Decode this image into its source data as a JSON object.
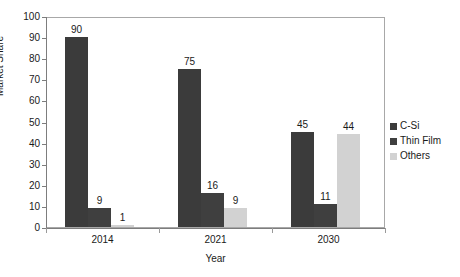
{
  "chart_data": {
    "type": "bar",
    "title": "",
    "xlabel": "Year",
    "ylabel": "Market Share",
    "categories": [
      "2014",
      "2021",
      "2030"
    ],
    "series": [
      {
        "name": "C-Si",
        "values": [
          90,
          75,
          45
        ],
        "color": "#3b3b3b"
      },
      {
        "name": "Thin Film",
        "values": [
          9,
          16,
          11
        ],
        "color": "#3f3f3f"
      },
      {
        "name": "Others",
        "values": [
          1,
          9,
          44
        ],
        "color": "#d2d2d2"
      }
    ],
    "ylim": [
      0,
      100
    ],
    "yticks": [
      0,
      10,
      20,
      30,
      40,
      50,
      60,
      70,
      80,
      90,
      100
    ],
    "grid": false,
    "legend_position": "right",
    "data_labels": true
  },
  "colors": {
    "background": "#ffffff",
    "plot_border": "#a8a8a8",
    "axis": "#7d7d7d",
    "text": "#1a1a1a",
    "c_si": "#3b3b3b",
    "thin_film": "#3f3f3f",
    "others": "#d2d2d2"
  }
}
